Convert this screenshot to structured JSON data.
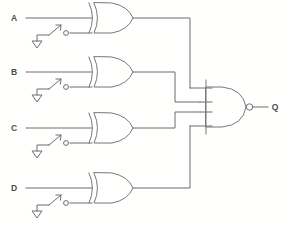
{
  "diagram": {
    "line_color": "#6c6c74",
    "background_color": "#ffffff"
  },
  "inputs": [
    {
      "label": "A",
      "switch": "spst-switch-open",
      "ground": "ground-symbol"
    },
    {
      "label": "B",
      "switch": "spst-switch-open",
      "ground": "ground-symbol"
    },
    {
      "label": "C",
      "switch": "spst-switch-open",
      "ground": "ground-symbol"
    },
    {
      "label": "D",
      "switch": "spst-switch-open",
      "ground": "ground-symbol"
    }
  ],
  "gates": [
    {
      "id": "xor-a",
      "type": "XOR",
      "inputs": 2
    },
    {
      "id": "xor-b",
      "type": "XOR",
      "inputs": 2
    },
    {
      "id": "xor-c",
      "type": "XOR",
      "inputs": 2
    },
    {
      "id": "xor-d",
      "type": "XOR",
      "inputs": 2
    },
    {
      "id": "nand-out",
      "type": "NAND",
      "inputs": 4
    }
  ],
  "output": {
    "label": "Q",
    "bubble": "inversion-bubble"
  }
}
